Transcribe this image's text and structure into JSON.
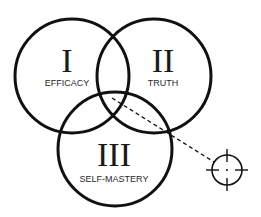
{
  "diagram": {
    "type": "venn",
    "circles": [
      {
        "numeral": "I",
        "label": "EFFICACY",
        "cx": 72,
        "cy": 76,
        "r": 57
      },
      {
        "numeral": "II",
        "label": "TRUTH",
        "cx": 154,
        "cy": 76,
        "r": 57
      },
      {
        "numeral": "III",
        "label": "SELF-MASTERY",
        "cx": 115,
        "cy": 149,
        "r": 57
      }
    ],
    "pointer": {
      "style": "dashed",
      "from": [
        112,
        98
      ],
      "to": [
        214,
        162
      ]
    },
    "target_icon": {
      "name": "crosshair",
      "cx": 227,
      "cy": 170,
      "r": 15
    },
    "colors": {
      "stroke": "#111111",
      "background": "#ffffff"
    }
  }
}
